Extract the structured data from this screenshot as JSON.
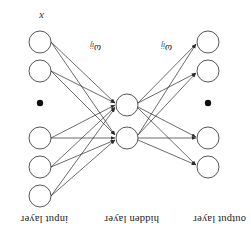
{
  "figure": {
    "title_labels": {
      "output": "output layer",
      "hidden": "hidden layer",
      "input": "input layer"
    },
    "weight_labels": {
      "hidden_to_output": "ω",
      "hidden_to_output_sub": "ij",
      "input_to_hidden": "ω",
      "input_to_hidden_sub": "ij"
    },
    "input_variable": "x",
    "ellipsis_glyph": "●",
    "colors": {
      "stroke": "#2b2b2b",
      "node_fill": "#ffffff",
      "text": "#1a1a1a",
      "background": "#ffffff"
    },
    "layers": {
      "input": {
        "name": "input layer",
        "node_count": 5,
        "has_ellipsis": true,
        "nodes": [
          {
            "label": "",
            "cx": 211,
            "cy": 38
          },
          {
            "label": "",
            "cx": 211,
            "cy": 67
          },
          {
            "label": "",
            "cx": 211,
            "cy": 96
          },
          {
            "label": "",
            "cx": 211,
            "cy": 163
          },
          {
            "label": "",
            "cx": 211,
            "cy": 192
          }
        ],
        "ellipsis": {
          "cx": 211,
          "cy": 131
        }
      },
      "hidden": {
        "name": "hidden layer",
        "node_count": 2,
        "has_ellipsis": false,
        "nodes": [
          {
            "label": "",
            "cx": 124,
            "cy": 96
          },
          {
            "label": "",
            "cx": 124,
            "cy": 129
          }
        ]
      },
      "output": {
        "name": "output layer",
        "node_count": 4,
        "has_ellipsis": true,
        "nodes": [
          {
            "label": "",
            "cx": 43,
            "cy": 67
          },
          {
            "label": "",
            "cx": 43,
            "cy": 96
          },
          {
            "label": "",
            "cx": 43,
            "cy": 163
          },
          {
            "label": "",
            "cx": 43,
            "cy": 192
          }
        ],
        "ellipsis": {
          "cx": 43,
          "cy": 131
        }
      }
    },
    "node_radius": 11,
    "edges_note": "fully connected input->hidden and hidden->output, arrowheads point toward hidden layer nodes and toward output layer nodes"
  }
}
